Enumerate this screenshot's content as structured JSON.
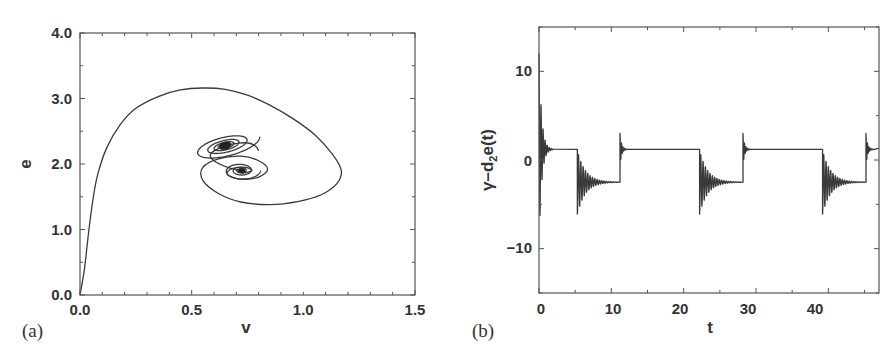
{
  "figure": {
    "panel_a": {
      "label": "(a)",
      "xlabel": "v",
      "ylabel": "e",
      "xticks": [
        "0.0",
        "0.5",
        "1.0",
        "1.5"
      ],
      "yticks": [
        "0.0",
        "1.0",
        "2.0",
        "3.0",
        "4.0"
      ]
    },
    "panel_b": {
      "label": "(b)",
      "xlabel": "t",
      "ylabel_main": "γ–d",
      "ylabel_sub": "2",
      "ylabel_tail": "e(t)",
      "xticks": [
        "0",
        "10",
        "20",
        "30",
        "40"
      ],
      "yticks": [
        "−10",
        "0",
        "10"
      ]
    }
  },
  "chart_data": [
    {
      "type": "line",
      "title": "",
      "panel": "(a)",
      "xlabel": "v",
      "ylabel": "e",
      "xlim": [
        0.0,
        1.5
      ],
      "ylim": [
        0.0,
        4.0
      ],
      "grid": false,
      "xticks": [
        0.0,
        0.5,
        1.0,
        1.5
      ],
      "yticks": [
        0.0,
        1.0,
        2.0,
        3.0,
        4.0
      ],
      "description": "Phase-plane trajectory starting at origin, rising steeply to e≈3.15 near v≈0.55, looping out to v≈1.17, down to e≈1.4, then spiraling into two foci near (0.72, 1.9) and (0.65, 2.28).",
      "series": [
        {
          "name": "trajectory",
          "points": [
            [
              0.0,
              0.0
            ],
            [
              0.02,
              0.4
            ],
            [
              0.04,
              1.0
            ],
            [
              0.06,
              1.5
            ],
            [
              0.08,
              1.85
            ],
            [
              0.12,
              2.25
            ],
            [
              0.18,
              2.6
            ],
            [
              0.25,
              2.85
            ],
            [
              0.35,
              3.03
            ],
            [
              0.45,
              3.13
            ],
            [
              0.55,
              3.16
            ],
            [
              0.65,
              3.14
            ],
            [
              0.75,
              3.05
            ],
            [
              0.85,
              2.9
            ],
            [
              0.95,
              2.7
            ],
            [
              1.05,
              2.45
            ],
            [
              1.13,
              2.15
            ],
            [
              1.17,
              1.9
            ],
            [
              1.15,
              1.7
            ],
            [
              1.08,
              1.53
            ],
            [
              0.98,
              1.43
            ],
            [
              0.85,
              1.38
            ],
            [
              0.72,
              1.42
            ],
            [
              0.62,
              1.55
            ],
            [
              0.55,
              1.75
            ],
            [
              0.55,
              1.95
            ],
            [
              0.62,
              2.08
            ],
            [
              0.72,
              2.12
            ],
            [
              0.8,
              2.05
            ],
            [
              0.84,
              1.92
            ],
            [
              0.8,
              1.8
            ],
            [
              0.72,
              1.77
            ],
            [
              0.66,
              1.84
            ],
            [
              0.68,
              1.93
            ],
            [
              0.74,
              1.95
            ],
            [
              0.77,
              1.9
            ],
            [
              0.73,
              1.86
            ],
            [
              0.71,
              1.9
            ]
          ]
        },
        {
          "name": "upper-spiral-focus",
          "center": [
            0.65,
            2.28
          ],
          "outer_radius_v": 0.16,
          "outer_radius_e": 0.33
        },
        {
          "name": "lower-spiral-focus",
          "center": [
            0.72,
            1.9
          ]
        }
      ]
    },
    {
      "type": "line",
      "title": "",
      "panel": "(b)",
      "xlabel": "t",
      "ylabel": "γ−d₂e(t)",
      "xlim": [
        0,
        47
      ],
      "ylim": [
        -15,
        15
      ],
      "grid": false,
      "xticks": [
        0,
        10,
        20,
        30,
        40
      ],
      "yticks": [
        -10,
        0,
        10
      ],
      "description": "Square-wave-like signal alternating between ≈1.2 and ≈−2.5 with damped ringing after each transition; initial transient spans ≈+12 to ≈−11.5.",
      "series": [
        {
          "name": "signal",
          "high_level": 1.2,
          "low_level": -2.5,
          "initial_transient": {
            "t": 0,
            "max": 12,
            "min": -11.5
          },
          "drops_at": [
            5.3,
            22.2,
            39.2
          ],
          "rises_at": [
            11.2,
            28.2,
            45.2
          ],
          "drop_overshoot_min": -6.0,
          "rise_overshoot_max": 3.0,
          "points": [
            [
              0,
              12
            ],
            [
              0.2,
              -11.5
            ],
            [
              0.4,
              6.5
            ],
            [
              0.6,
              -5
            ],
            [
              0.8,
              3
            ],
            [
              1.0,
              -1
            ],
            [
              1.3,
              1.5
            ],
            [
              2,
              1.2
            ],
            [
              5.3,
              1.2
            ],
            [
              5.5,
              -6
            ],
            [
              6,
              0
            ],
            [
              7,
              -4
            ],
            [
              8,
              -2
            ],
            [
              9,
              -2.6
            ],
            [
              11.2,
              -2.5
            ],
            [
              11.3,
              3
            ],
            [
              11.7,
              0.8
            ],
            [
              12.2,
              1.2
            ],
            [
              22.2,
              1.2
            ],
            [
              22.4,
              -6
            ],
            [
              23,
              0
            ],
            [
              24,
              -4
            ],
            [
              25,
              -2
            ],
            [
              26,
              -2.6
            ],
            [
              28.2,
              -2.5
            ],
            [
              28.3,
              3
            ],
            [
              28.7,
              0.8
            ],
            [
              29.2,
              1.3
            ],
            [
              39.2,
              1.3
            ],
            [
              39.4,
              -6
            ],
            [
              40,
              0
            ],
            [
              41,
              -4
            ],
            [
              42,
              -2
            ],
            [
              43,
              -2.6
            ],
            [
              45.2,
              -2.4
            ],
            [
              45.3,
              3
            ],
            [
              45.7,
              0.8
            ],
            [
              46.2,
              1.4
            ],
            [
              47,
              1.4
            ]
          ]
        }
      ]
    }
  ]
}
